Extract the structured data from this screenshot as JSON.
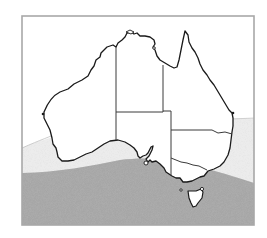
{
  "map": {
    "title": "Australia zone map",
    "subject": "Australia with states and territories",
    "regions": [
      "Western Australia",
      "Northern Territory",
      "Queensland",
      "South Australia",
      "New South Wales",
      "Victoria",
      "Tasmania"
    ],
    "zones": [
      {
        "name": "light-stipple-zone",
        "description": "Light stippled band across southern mainland",
        "color": "#e4e4e4"
      },
      {
        "name": "dark-stipple-zone",
        "description": "Dark stippled zone covering southern coast, Tasmania and ocean",
        "color": "#9c9c9c"
      }
    ],
    "colors": {
      "frame": "#a8a8a8",
      "land": "#ffffff",
      "coastline": "#1a1a1a",
      "borders": "#3a3a3a"
    }
  }
}
